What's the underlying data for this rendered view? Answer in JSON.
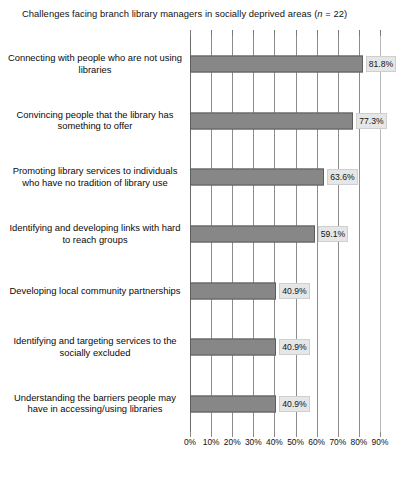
{
  "chart_data": {
    "type": "bar",
    "orientation": "horizontal",
    "title": "Challenges facing branch library managers in socially deprived areas (n = 22)",
    "title_plain": "Challenges facing branch library managers in socially deprived areas (",
    "title_italic": "n",
    "title_tail": " = 22)",
    "xlabel": "",
    "ylabel": "",
    "xlim": [
      0,
      90
    ],
    "grid": true,
    "legend": false,
    "categories": [
      "Connecting with people who are not using libraries",
      "Convincing people that the library has something to offer",
      "Promoting library services to individuals who have no tradition of library use",
      "Identifying and developing links with hard to reach groups",
      "Developing local community partnerships",
      "Identifying and targeting services to the socially excluded",
      "Understanding the barriers people may have in accessing/using libraries"
    ],
    "values": [
      81.8,
      77.3,
      63.6,
      59.1,
      40.9,
      40.9,
      40.9
    ],
    "value_labels": [
      "81.8%",
      "77.3%",
      "63.6%",
      "59.1%",
      "40.9%",
      "40.9%",
      "40.9%"
    ],
    "xticks": [
      0,
      10,
      20,
      30,
      40,
      50,
      60,
      70,
      80,
      90
    ],
    "xtick_labels": [
      "0%",
      "10%",
      "20%",
      "30%",
      "40%",
      "50%",
      "60%",
      "70%",
      "80%",
      "90%"
    ],
    "colors": {
      "bar_fill": "#878787",
      "bar_edge": "#5d5d5d",
      "label_box": "#e6e6e6",
      "gridline": "#8c8c8c",
      "text": "#0a0a0a"
    }
  },
  "caption": {
    "text": ""
  }
}
